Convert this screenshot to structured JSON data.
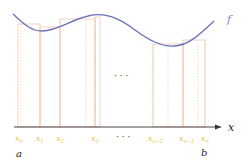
{
  "diagram": {
    "type": "riemann-sum",
    "function_label": "f",
    "axis_label": "x",
    "interval_start_label": "a",
    "interval_end_label": "b",
    "ellipsis": "· · ·",
    "partition_labels": [
      "x₀",
      "x₁",
      "x₂",
      "x₃",
      "x_{n−2}",
      "x_{n−1}",
      "xₙ"
    ],
    "partition_label_display": [
      "x",
      "x",
      "x",
      "x",
      "x",
      "x",
      "x"
    ],
    "partition_label_subscripts": [
      "0",
      "1",
      "2",
      "3",
      "n−2",
      "n−1",
      "n"
    ],
    "colors": {
      "curve": "#6a6fb8",
      "rectangle_outline": "#f2b9a8",
      "partition_line": "#e8d9a0",
      "label": "#e6c34a",
      "axis": "#333333",
      "text": "#222222"
    }
  }
}
